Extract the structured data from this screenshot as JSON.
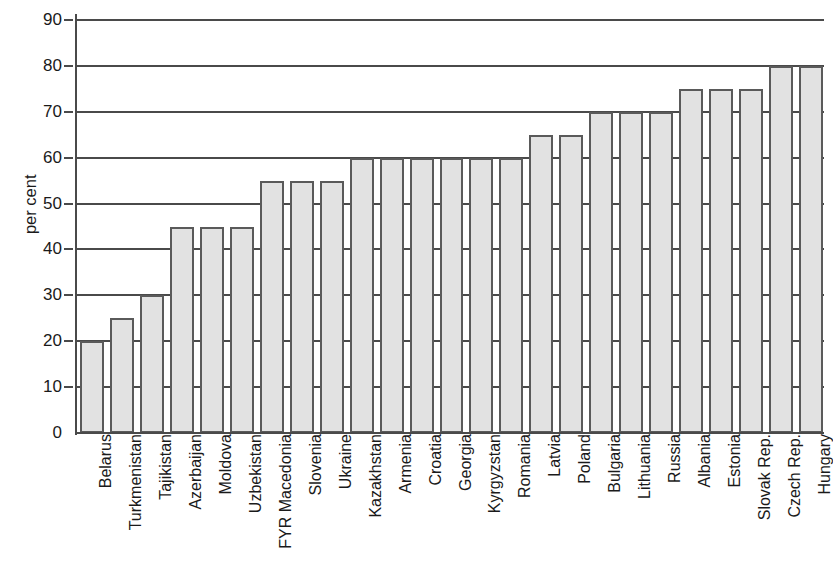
{
  "chart_data": {
    "type": "bar",
    "title": "",
    "subtitle": "",
    "xlabel": "",
    "ylabel": "per cent",
    "ylim": [
      0,
      90
    ],
    "ytick_step": 10,
    "yticks": [
      0,
      10,
      20,
      30,
      40,
      50,
      60,
      70,
      80,
      90
    ],
    "ytick_labels": [
      "0",
      "10",
      "20",
      "30",
      "40",
      "50",
      "60",
      "70",
      "80",
      "90"
    ],
    "grid": "horizontal",
    "legend": null,
    "legend_position": "none",
    "categories": [
      "Belarus",
      "Turkmenistan",
      "Tajikistan",
      "Azerbaijan",
      "Moldova",
      "Uzbekistan",
      "FYR Macedonia",
      "Slovenia",
      "Ukraine",
      "Kazakhstan",
      "Armenia",
      "Croatia",
      "Georgia",
      "Kyrgyzstan",
      "Romania",
      "Latvia",
      "Poland",
      "Bulgaria",
      "Lithuania",
      "Russia",
      "Albania",
      "Estonia",
      "Slovak Rep.",
      "Czech Rep.",
      "Hungary"
    ],
    "values": [
      20,
      25,
      30,
      45,
      45,
      45,
      55,
      55,
      55,
      60,
      60,
      60,
      60,
      60,
      60,
      65,
      65,
      70,
      70,
      70,
      75,
      75,
      75,
      80,
      80
    ],
    "bar_fill_color": "#e2e2e2",
    "bar_edge_color": "#5a5a5a",
    "axis_color": "#4a4a4a",
    "background_color": "#ffffff"
  }
}
